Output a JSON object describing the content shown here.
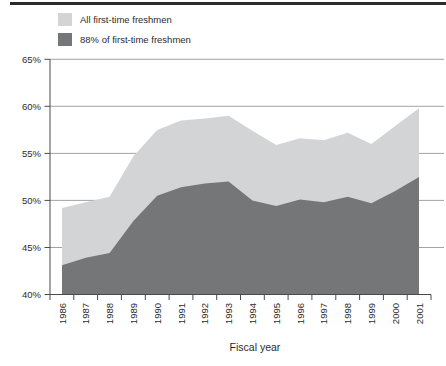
{
  "figure": {
    "xlabel": "Fiscal year"
  },
  "colors": {
    "background": "#ffffff",
    "top_rule": "#2b2b2b",
    "gridline": "#8c8c8c",
    "axis": "#4a4a4a",
    "text": "#2b2b2b",
    "area_all": "#d3d4d5",
    "area_88": "#747678"
  },
  "chart_data": {
    "type": "area",
    "title": "",
    "xlabel": "Fiscal year",
    "ylabel": "",
    "categories": [
      "1986",
      "1987",
      "1988",
      "1989",
      "1990",
      "1991",
      "1992",
      "1993",
      "1994",
      "1995",
      "1996",
      "1997",
      "1998",
      "1999",
      "2000",
      "2001"
    ],
    "series": [
      {
        "name": "All first-time freshmen",
        "color": "#d3d4d5",
        "values": [
          49.2,
          49.8,
          50.4,
          54.7,
          57.5,
          58.5,
          58.7,
          59.0,
          57.4,
          55.9,
          56.6,
          56.4,
          57.2,
          56.0,
          57.9,
          59.8
        ]
      },
      {
        "name": "88% of first-time freshmen",
        "color": "#747678",
        "values": [
          43.1,
          43.9,
          44.4,
          47.8,
          50.5,
          51.4,
          51.8,
          52.0,
          50.0,
          49.4,
          50.1,
          49.8,
          50.4,
          49.7,
          51.0,
          52.5
        ]
      }
    ],
    "ylim": [
      40,
      65
    ],
    "yticks": [
      40,
      45,
      50,
      55,
      60,
      65
    ],
    "ytick_labels": [
      "40%",
      "45%",
      "50%",
      "55%",
      "60%",
      "65%"
    ],
    "grid": true,
    "legend_position": "top-left",
    "x_tick_style": "category-boundaries",
    "x_label_rotation": -90
  }
}
